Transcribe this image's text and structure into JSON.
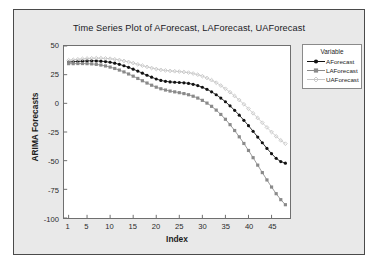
{
  "figure": {
    "title": "Time Series Plot of AForecast, LAForecast, UAForecast",
    "background_color": "#e9e9e9",
    "plot_background_color": "#ffffff",
    "border_color": "#4a4a4a"
  },
  "legend": {
    "title": "Variable",
    "entries": [
      {
        "label": "AForecast",
        "color": "#121212",
        "marker": "filled-circle-marker"
      },
      {
        "label": "LAForecast",
        "color": "#8a8a8a",
        "marker": "filled-square-marker"
      },
      {
        "label": "UAForecast",
        "color": "#c6c6c6",
        "marker": "open-diamond-marker"
      }
    ]
  },
  "chart_data": {
    "type": "line",
    "title": "Time Series Plot of AForecast, LAForecast, UAForecast",
    "xlabel": "Index",
    "ylabel": "ARIMA Forecasts",
    "xlim": [
      0,
      49
    ],
    "ylim": [
      -100,
      50
    ],
    "xticks": [
      1,
      5,
      10,
      15,
      20,
      25,
      30,
      35,
      40,
      45
    ],
    "yticks": [
      50,
      25,
      0,
      -25,
      -50,
      -75,
      -100
    ],
    "grid": false,
    "legend_position": "right-outside",
    "x": [
      1,
      2,
      3,
      4,
      5,
      6,
      7,
      8,
      9,
      10,
      11,
      12,
      13,
      14,
      15,
      16,
      17,
      18,
      19,
      20,
      21,
      22,
      23,
      24,
      25,
      26,
      27,
      28,
      29,
      30,
      31,
      32,
      33,
      34,
      35,
      36,
      37,
      38,
      39,
      40,
      41,
      42,
      43,
      44,
      45,
      46,
      47,
      48
    ],
    "series": [
      {
        "name": "AForecast",
        "color": "#121212",
        "marker": "filled-circle-marker",
        "values": [
          36.0,
          36.3,
          36.6,
          36.8,
          37.0,
          37.1,
          37.0,
          36.8,
          36.4,
          35.8,
          35.0,
          34.0,
          32.8,
          31.4,
          29.8,
          28.1,
          26.3,
          24.5,
          22.8,
          21.2,
          20.0,
          19.2,
          18.7,
          18.4,
          18.2,
          17.9,
          17.4,
          16.6,
          15.5,
          14.0,
          12.2,
          10.0,
          7.5,
          4.6,
          1.4,
          -2.2,
          -6.1,
          -10.3,
          -14.8,
          -19.5,
          -24.4,
          -29.4,
          -34.4,
          -39.3,
          -43.9,
          -48.0,
          -50.8,
          -52.2
        ]
      },
      {
        "name": "LAForecast",
        "color": "#8a8a8a",
        "marker": "filled-square-marker",
        "values": [
          34.6,
          34.6,
          34.7,
          34.7,
          34.6,
          34.4,
          34.0,
          33.4,
          32.6,
          31.6,
          30.4,
          29.0,
          27.4,
          25.6,
          23.7,
          21.7,
          19.7,
          17.7,
          15.8,
          14.1,
          12.7,
          11.6,
          10.7,
          10.0,
          9.3,
          8.5,
          7.5,
          6.2,
          4.6,
          2.6,
          0.2,
          -2.6,
          -5.9,
          -9.7,
          -13.9,
          -18.6,
          -23.7,
          -29.2,
          -35.0,
          -41.1,
          -47.4,
          -53.9,
          -60.4,
          -66.8,
          -73.0,
          -78.8,
          -84.0,
          -88.4
        ]
      },
      {
        "name": "UAForecast",
        "color": "#c6c6c6",
        "marker": "open-diamond-marker",
        "values": [
          37.6,
          38.0,
          38.4,
          38.8,
          39.1,
          39.3,
          39.4,
          39.4,
          39.2,
          38.9,
          38.4,
          37.8,
          37.0,
          36.1,
          35.1,
          34.0,
          32.9,
          31.8,
          30.8,
          29.9,
          29.2,
          28.7,
          28.3,
          28.0,
          27.7,
          27.3,
          26.8,
          26.0,
          25.0,
          23.7,
          22.1,
          20.2,
          18.0,
          15.5,
          12.7,
          9.7,
          6.4,
          2.9,
          -0.8,
          -4.7,
          -8.7,
          -12.8,
          -16.9,
          -21.0,
          -25.0,
          -28.8,
          -32.3,
          -35.2
        ]
      }
    ]
  }
}
